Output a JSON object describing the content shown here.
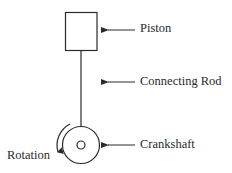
{
  "diagram": {
    "type": "mechanical-schematic",
    "colors": {
      "stroke": "#2a2a2a",
      "background": "#ffffff",
      "text": "#2a2a2a"
    },
    "components": [
      {
        "id": "piston",
        "label": "Piston",
        "shape": "rectangle"
      },
      {
        "id": "connecting-rod",
        "label": "Connecting Rod",
        "shape": "line"
      },
      {
        "id": "crankshaft",
        "label": "Crankshaft",
        "shape": "concentric-circles"
      }
    ],
    "annotations": {
      "rotation": {
        "label": "Rotation",
        "direction": "counter-clockwise"
      }
    }
  },
  "labels": {
    "piston": "Piston",
    "connecting_rod": "Connecting Rod",
    "crankshaft": "Crankshaft",
    "rotation": "Rotation"
  }
}
